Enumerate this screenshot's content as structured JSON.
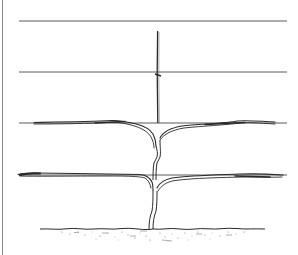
{
  "figure": {
    "style": "black and white line illustration",
    "background": "#ffffff",
    "ink": "#2a2a2a",
    "wire_color": "#555555",
    "border": {
      "side": "left",
      "x": 2,
      "color": "#888888"
    },
    "wires": [
      {
        "name": "wire-1",
        "y": 21,
        "x1": 19,
        "x2": 287
      },
      {
        "name": "wire-2",
        "y": 72,
        "x1": 19,
        "x2": 287
      },
      {
        "name": "wire-3",
        "y": 123,
        "x1": 19,
        "x2": 287
      },
      {
        "name": "wire-4",
        "y": 175,
        "x1": 19,
        "x2": 287
      }
    ],
    "stake": {
      "x": 158,
      "y_top": 31,
      "y_bottom": 123,
      "tie_y": 75
    },
    "trunk": {
      "x": 157,
      "y_top": 123,
      "y_bottom": 229
    },
    "cordons": [
      {
        "tier": "upper",
        "y": 123,
        "left_end": 34,
        "right_end": 275
      },
      {
        "tier": "lower",
        "y": 175,
        "left_end": 18,
        "right_end": 283
      }
    ],
    "ground": {
      "y": 229,
      "x1": 40,
      "x2": 265
    }
  }
}
